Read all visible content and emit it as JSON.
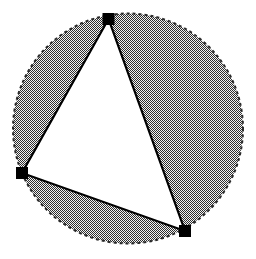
{
  "figure": {
    "canvas": {
      "width": 256,
      "height": 259,
      "background": "#ffffff"
    },
    "circle": {
      "label": "circumscribed circle",
      "cx": 128,
      "cy": 128.5,
      "r": 115,
      "fill": "#9d9d9d",
      "fill_pattern": "checkerboard-dither-50",
      "stroke": "#2b2b2b",
      "stroke_width": 2,
      "stroke_style": "dashed",
      "dash_pattern": "3 3"
    },
    "triangle": {
      "label": "inscribed triangle",
      "fill": "#ffffff",
      "stroke": "#000000",
      "stroke_width": 2.2,
      "points": "108.5,19 22,173 185,231",
      "vertices": [
        {
          "name": "apex-vertex",
          "x": 108.5,
          "y": 19
        },
        {
          "name": "left-vertex",
          "x": 22,
          "y": 173
        },
        {
          "name": "bottom-right-vertex",
          "x": 185,
          "y": 231
        }
      ]
    },
    "vertex_marker": {
      "shape": "square",
      "size": 12,
      "fill": "#000000"
    }
  }
}
